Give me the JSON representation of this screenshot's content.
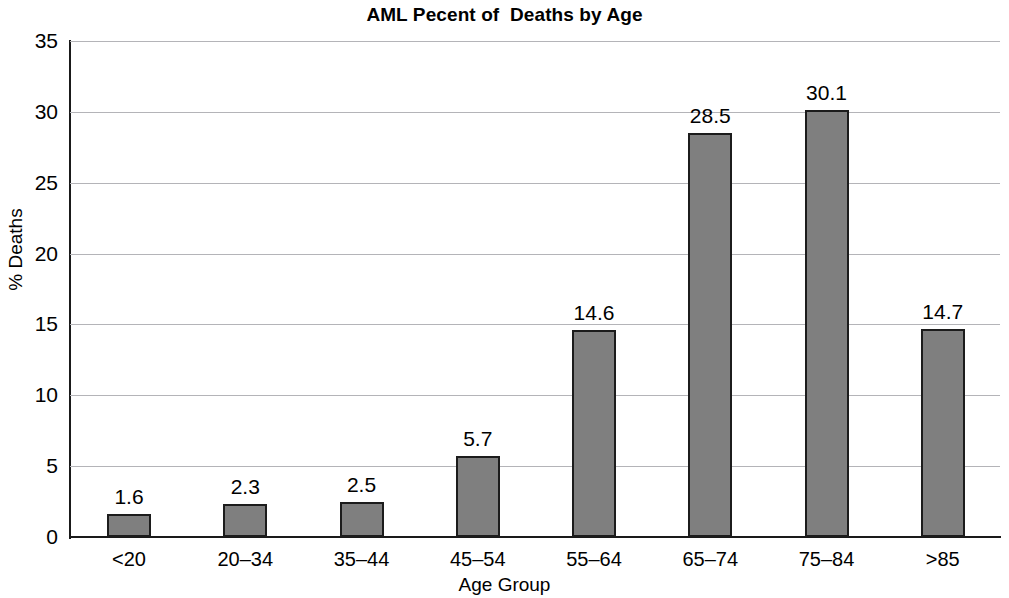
{
  "chart_data": {
    "type": "bar",
    "title": "AML Pecent of  Deaths by Age",
    "xlabel": "Age Group",
    "ylabel": "% Deaths",
    "categories": [
      "<20",
      "20–34",
      "35–44",
      "45–54",
      "55–64",
      "65–74",
      "75–84",
      ">85"
    ],
    "values": [
      1.6,
      2.3,
      2.5,
      5.7,
      14.6,
      28.5,
      30.1,
      14.7
    ],
    "value_labels": [
      "1.6",
      "2.3",
      "2.5",
      "5.7",
      "14.6",
      "28.5",
      "30.1",
      "14.7"
    ],
    "ylim": [
      0,
      35
    ],
    "yticks": [
      0,
      5,
      10,
      15,
      20,
      25,
      30,
      35
    ],
    "ytick_labels": [
      "0",
      "5",
      "10",
      "15",
      "20",
      "25",
      "30",
      "35"
    ],
    "grid": true,
    "grid_axis": "y",
    "legend": null,
    "bar_color": "#7f7f7f",
    "bar_edge_color": "#1c1c1c",
    "grid_color": "#b4b4b8",
    "axis_color": "#1a1a1a",
    "background": "#ffffff"
  }
}
